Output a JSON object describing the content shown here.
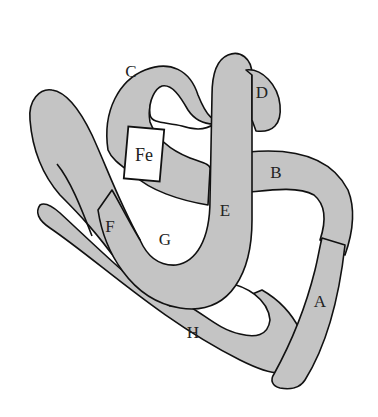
{
  "diagram": {
    "type": "protein-tertiary-structure",
    "colors": {
      "helix_fill": "#c4c4c4",
      "outline": "#111111",
      "background": "#ffffff"
    },
    "helices": [
      {
        "id": "A",
        "label": "A"
      },
      {
        "id": "B",
        "label": "B"
      },
      {
        "id": "C",
        "label": "C"
      },
      {
        "id": "D",
        "label": "D"
      },
      {
        "id": "E",
        "label": "E"
      },
      {
        "id": "F",
        "label": "F"
      },
      {
        "id": "G",
        "label": "G"
      },
      {
        "id": "H",
        "label": "H"
      }
    ],
    "heme": {
      "label": "Fe"
    }
  }
}
